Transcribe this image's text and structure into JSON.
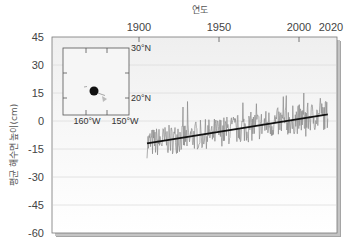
{
  "chart_data": {
    "type": "line",
    "title": "",
    "xlabel": "연도",
    "ylabel": "평균 해수면 높이(cm)",
    "xlabel_position": "top",
    "x_tick_labels": [
      "1900",
      "1950",
      "2000",
      "2020"
    ],
    "x_ticks": [
      1900,
      1950,
      2000
    ],
    "y_tick_labels": [
      "45",
      "30",
      "15",
      "0",
      "-15",
      "-30",
      "-45",
      "-60"
    ],
    "y_ticks": [
      45,
      30,
      15,
      0,
      -15,
      -30,
      -45,
      -60
    ],
    "xlim": [
      1846,
      2024
    ],
    "ylim": [
      -60,
      45
    ],
    "grid": {
      "horizontal": true,
      "vertical": false
    },
    "legend": null,
    "series": [
      {
        "name": "monthly mean sea level",
        "color": "#8a8a8a",
        "x_range": [
          1905,
          2018
        ],
        "approx_envelope": {
          "min": -25,
          "max": 15
        },
        "note": "noisy monthly series fluctuating around trend line"
      },
      {
        "name": "linear trend",
        "color": "#111111",
        "x": [
          1905,
          2018
        ],
        "values": [
          -12,
          3.5
        ]
      }
    ],
    "annotations": [
      {
        "type": "inset_map",
        "labels": [
          "30°N",
          "20°N",
          "160°W",
          "150°W"
        ],
        "marker": "station location (Honolulu, Hawaii)"
      }
    ]
  },
  "inset": {
    "lat_top": "30°N",
    "lat_bottom": "20°N",
    "lon_left": "160°W",
    "lon_right": "150°W"
  },
  "colors": {
    "plot_bg_top": "#f2f2f2",
    "plot_bg": "#ffffff",
    "grid": "#dddddd",
    "series": "#8a8a8a",
    "trend": "#111111",
    "frame": "#666666",
    "shadow": "#9a9a9a"
  }
}
